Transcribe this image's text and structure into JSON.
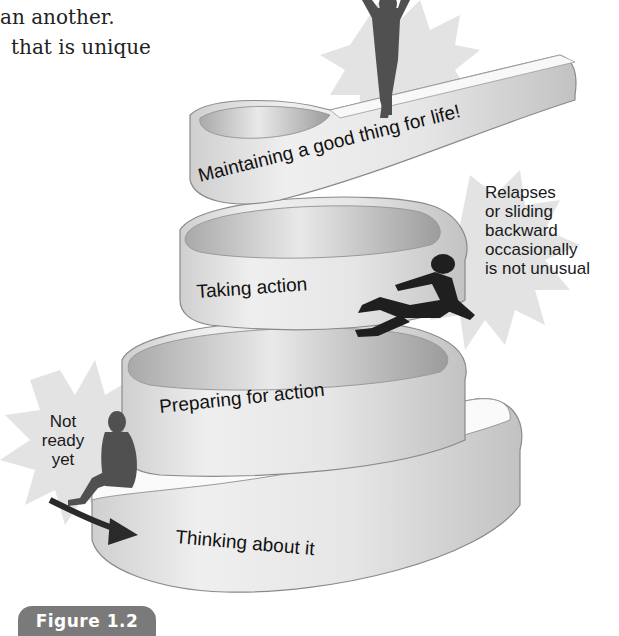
{
  "body_text": {
    "line1": "an another.",
    "line2": "that is unique"
  },
  "diagram": {
    "type": "spiral-stages",
    "stages": [
      {
        "order": 1,
        "label": "Thinking about it"
      },
      {
        "order": 2,
        "label": "Preparing for action"
      },
      {
        "order": 3,
        "label": "Taking action"
      },
      {
        "order": 4,
        "label": "Maintaining a good thing for life!"
      }
    ],
    "callouts": {
      "not_ready": [
        "Not",
        "ready",
        "yet"
      ],
      "relapse": [
        "Relapses",
        "or sliding",
        "backward",
        "occasionally",
        "is not unusual"
      ]
    },
    "figures": [
      {
        "name": "sitting-person",
        "meaning": "Not ready yet"
      },
      {
        "name": "falling-person",
        "meaning": "Relapse"
      },
      {
        "name": "triumphant-person",
        "meaning": "Maintaining"
      }
    ],
    "colors": {
      "ribbon": "#e4e4e4",
      "ribbon_edge": "#8a8a8a",
      "ribbon_inner": "#bdbdbd",
      "starburst": "#dcdcdc",
      "silhouette_dark": "#1f1f1f",
      "silhouette_grey": "#505050",
      "badge": "#7a7a7a"
    }
  },
  "figure_caption": {
    "label": "Figure 1.2"
  }
}
